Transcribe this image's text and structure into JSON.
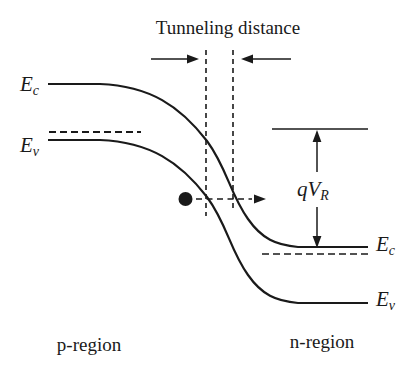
{
  "diagram": {
    "title": "Tunneling distance",
    "regions": {
      "left": "p-region",
      "right": "n-region"
    },
    "levels": {
      "ec_left": {
        "base": "E",
        "sub": "c"
      },
      "ev_left": {
        "base": "E",
        "sub": "v"
      },
      "ec_right": {
        "base": "E",
        "sub": "c"
      },
      "ev_right": {
        "base": "E",
        "sub": "v"
      }
    },
    "bias": {
      "base": "qV",
      "sub": "R"
    },
    "colors": {
      "ink": "#1a1a1a",
      "background": "#ffffff"
    }
  }
}
